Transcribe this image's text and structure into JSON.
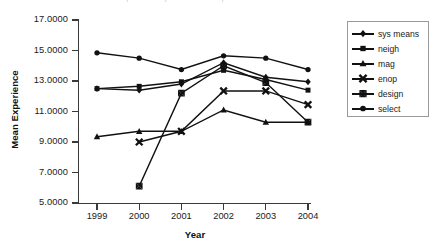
{
  "title_clipped": "Mean Experience by Year and Group",
  "axes": {
    "ylabel": "Mean Experience",
    "xlabel": "Year",
    "yticks": [
      "5.0000",
      "7.0000",
      "9.0000",
      "11.0000",
      "13.0000",
      "15.0000",
      "17.0000"
    ],
    "xticks": [
      "1999",
      "2000",
      "2001",
      "2002",
      "2003",
      "2004"
    ]
  },
  "legend": {
    "items": [
      {
        "label": "sys means",
        "marker": "diamond"
      },
      {
        "label": "neigh",
        "marker": "square"
      },
      {
        "label": "mag",
        "marker": "triangle"
      },
      {
        "label": "enop",
        "marker": "cross"
      },
      {
        "label": "design",
        "marker": "bowtie"
      },
      {
        "label": "select",
        "marker": "circle"
      }
    ]
  },
  "chart_data": {
    "type": "line",
    "title": "Mean Experience by Year and Group",
    "xlabel": "Year",
    "ylabel": "Mean Experience",
    "x": [
      1999,
      2000,
      2001,
      2002,
      2003,
      2004
    ],
    "categories": [
      "1999",
      "2000",
      "2001",
      "2002",
      "2003",
      "2004"
    ],
    "ylim": [
      5.0,
      17.0
    ],
    "ytick_step": 2.0,
    "grid": false,
    "legend_position": "right",
    "line_color": "#111111",
    "series": [
      {
        "name": "sys means",
        "marker": "diamond",
        "values": [
          12.5,
          12.4,
          12.8,
          14.2,
          13.25,
          12.95
        ]
      },
      {
        "name": "neigh",
        "marker": "square",
        "values": [
          12.5,
          12.65,
          12.95,
          13.7,
          13.1,
          12.4
        ]
      },
      {
        "name": "mag",
        "marker": "triangle",
        "values": [
          9.35,
          9.7,
          9.7,
          11.1,
          10.3,
          10.3
        ]
      },
      {
        "name": "enop",
        "marker": "cross",
        "values": [
          null,
          9.0,
          9.7,
          12.35,
          12.35,
          11.45
        ]
      },
      {
        "name": "design",
        "marker": "bowtie",
        "values": [
          null,
          6.1,
          12.2,
          14.0,
          12.9,
          10.3
        ]
      },
      {
        "name": "select",
        "marker": "circle",
        "values": [
          14.85,
          14.5,
          13.75,
          14.65,
          14.5,
          13.75
        ]
      }
    ]
  }
}
